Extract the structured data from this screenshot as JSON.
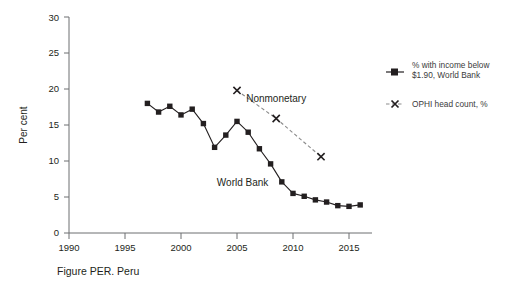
{
  "caption": "Figure PER. Peru",
  "legend": {
    "items": [
      {
        "label_line1": "% with income below",
        "label_line2": "$1.90, World Bank",
        "marker": "filled-square-solid-line",
        "color": "#231f20"
      },
      {
        "label_line1": "OPHI head count, %",
        "label_line2": "",
        "marker": "x-dashed-line",
        "color": "#231f20"
      }
    ]
  },
  "annotations": {
    "world_bank": "World Bank",
    "nonmonetary": "Nonmonetary"
  },
  "axis": {
    "y_title": "Per cent",
    "y_ticks": [
      "0",
      "5",
      "10",
      "15",
      "20",
      "25",
      "30"
    ],
    "x_ticks": [
      "1990",
      "1995",
      "2000",
      "2005",
      "2010",
      "2015"
    ]
  },
  "chart_data": {
    "type": "line",
    "title": "Figure PER. Peru",
    "xlabel": "",
    "ylabel": "Per cent",
    "xlim": [
      1989,
      2017
    ],
    "ylim": [
      0,
      30
    ],
    "grid": false,
    "legend_position": "right",
    "series": [
      {
        "name": "% with income below $1.90, World Bank",
        "marker": "square",
        "linestyle": "solid",
        "color": "#231f20",
        "x": [
          1997,
          1998,
          1999,
          2000,
          2001,
          2002,
          2003,
          2004,
          2005,
          2006,
          2007,
          2008,
          2009,
          2010,
          2011,
          2012,
          2013,
          2014,
          2015,
          2016
        ],
        "values": [
          18.0,
          16.8,
          17.6,
          16.4,
          17.2,
          15.2,
          11.9,
          13.6,
          15.5,
          14.0,
          11.7,
          9.6,
          7.1,
          5.5,
          5.1,
          4.6,
          4.3,
          3.8,
          3.7,
          3.9
        ]
      },
      {
        "name": "OPHI head count, %",
        "marker": "x",
        "linestyle": "dashed",
        "color": "#8b8b8b",
        "x": [
          2005,
          2008.5,
          2012.5
        ],
        "values": [
          19.8,
          15.9,
          10.6
        ]
      }
    ],
    "annotations": [
      {
        "text": "World Bank",
        "x": 2005.5,
        "y": 6.6
      },
      {
        "text": "Nonmonetary",
        "x": 2008.5,
        "y": 18.2
      }
    ]
  }
}
